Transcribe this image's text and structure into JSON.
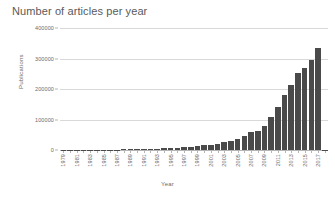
{
  "chart_data": {
    "type": "bar",
    "title": "Number of articles per year",
    "xlabel": "Year",
    "ylabel": "Publications",
    "ylim": [
      0,
      400000
    ],
    "yticks": [
      0,
      100000,
      200000,
      300000,
      400000
    ],
    "ytick_labels": [
      "0",
      "100000",
      "200000",
      "300000",
      "400000"
    ],
    "grid": true,
    "legend": null,
    "bar_color": "#4a4a4a",
    "gridline_color": "#d9d9d9",
    "axis_color": "#b5b5b5",
    "text_color": "#6b6b6b",
    "xtick_label_rotation": 90,
    "xtick_labels_shown": [
      "1979",
      "1981",
      "1983",
      "1985",
      "1987",
      "1989",
      "1991",
      "1993",
      "1995",
      "1997",
      "1999",
      "2001",
      "2003",
      "2005",
      "2007",
      "2009",
      "2011",
      "2013",
      "2015",
      "2017"
    ],
    "categories": [
      "1979",
      "1980",
      "1981",
      "1982",
      "1983",
      "1984",
      "1985",
      "1986",
      "1987",
      "1988",
      "1989",
      "1990",
      "1991",
      "1992",
      "1993",
      "1994",
      "1995",
      "1996",
      "1997",
      "1998",
      "1999",
      "2000",
      "2001",
      "2002",
      "2003",
      "2004",
      "2005",
      "2006",
      "2007",
      "2008",
      "2009",
      "2010",
      "2011",
      "2012",
      "2013",
      "2014",
      "2015",
      "2016",
      "2017",
      "2018"
    ],
    "values": [
      400,
      500,
      600,
      700,
      900,
      1000,
      1200,
      1400,
      1600,
      1900,
      2200,
      2600,
      3000,
      3500,
      4200,
      5000,
      6000,
      7200,
      8600,
      10500,
      12500,
      15000,
      18000,
      21000,
      25000,
      30000,
      36000,
      45000,
      58000,
      62000,
      80000,
      108000,
      141000,
      180000,
      213000,
      251000,
      268000,
      294000,
      335000,
      0
    ]
  }
}
